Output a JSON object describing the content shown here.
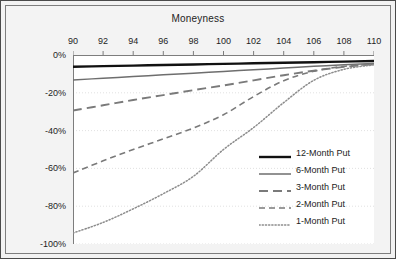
{
  "figure": {
    "title": "Moneyness",
    "ylabel": "Monthly Return",
    "background_color": "#f3f3f3",
    "plot_background_color": "#ffffff",
    "border_color": "#4a4a4a"
  },
  "axes": {
    "x_ticks": [
      "90",
      "92",
      "94",
      "96",
      "98",
      "100",
      "102",
      "104",
      "106",
      "108",
      "110"
    ],
    "y_ticks": [
      "0%",
      "-20%",
      "-40%",
      "-60%",
      "-80%",
      "-100%"
    ]
  },
  "legend": {
    "items": [
      {
        "label": "12-Month Put",
        "style": "solid-thick",
        "color": "#111111"
      },
      {
        "label": "6-Month Put",
        "style": "solid-thin",
        "color": "#6e6e6e"
      },
      {
        "label": "3-Month Put",
        "style": "long-dash",
        "color": "#7a7a7a"
      },
      {
        "label": "2-Month Put",
        "style": "medium-dash",
        "color": "#7a7a7a"
      },
      {
        "label": "1-Month Put",
        "style": "dotted",
        "color": "#8c8c8c"
      }
    ]
  },
  "chart_data": {
    "type": "line",
    "title": "Moneyness",
    "xlabel": "Moneyness",
    "ylabel": "Monthly Return",
    "xlim": [
      90,
      110
    ],
    "ylim": [
      -100,
      0
    ],
    "xticks": [
      90,
      92,
      94,
      96,
      98,
      100,
      102,
      104,
      106,
      108,
      110
    ],
    "yticks": [
      0,
      -20,
      -40,
      -60,
      -80,
      -100
    ],
    "grid": true,
    "legend_position": "right-middle",
    "x": [
      90,
      92,
      94,
      96,
      98,
      100,
      102,
      104,
      106,
      108,
      110
    ],
    "series": [
      {
        "name": "12-Month Put",
        "style": "solid-thick",
        "color": "#111111",
        "values": [
          -6.2,
          -5.9,
          -5.6,
          -5.3,
          -5.0,
          -4.7,
          -4.4,
          -4.1,
          -3.8,
          -3.5,
          -3.2
        ]
      },
      {
        "name": "6-Month Put",
        "style": "solid-thin",
        "color": "#6e6e6e",
        "values": [
          -13.2,
          -12.3,
          -11.4,
          -10.5,
          -9.6,
          -8.7,
          -7.8,
          -6.9,
          -6.0,
          -5.2,
          -4.5
        ]
      },
      {
        "name": "3-Month Put",
        "style": "long-dash",
        "color": "#7a7a7a",
        "values": [
          -29.4,
          -26.6,
          -23.8,
          -21.2,
          -18.6,
          -16.1,
          -13.4,
          -10.7,
          -8.3,
          -6.3,
          -4.8
        ]
      },
      {
        "name": "2-Month Put",
        "style": "medium-dash",
        "color": "#7a7a7a",
        "values": [
          -62.4,
          -56.0,
          -50.0,
          -44.4,
          -38.6,
          -31.6,
          -22.0,
          -13.6,
          -8.6,
          -6.0,
          -4.9
        ]
      },
      {
        "name": "1-Month Put",
        "style": "dotted",
        "color": "#8c8c8c",
        "values": [
          -94.2,
          -88.6,
          -81.4,
          -73.4,
          -64.2,
          -50.0,
          -38.4,
          -25.2,
          -13.4,
          -7.6,
          -5.2
        ]
      }
    ]
  }
}
